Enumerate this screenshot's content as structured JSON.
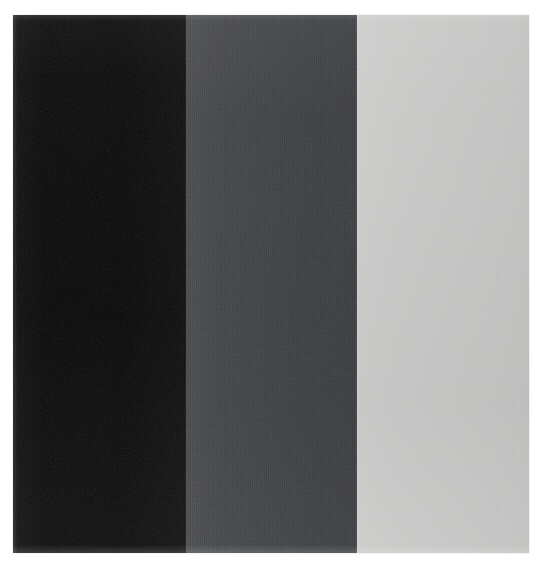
{
  "artwork": {
    "kind": "abstract-painting-photograph",
    "description": "Three vertical bands of graduated grey tone on a square canvas",
    "background_color": "#ffffff",
    "panel": {
      "left": 13,
      "top": 15,
      "width": 516,
      "height": 538
    },
    "bands": [
      {
        "name": "dark-band",
        "label": "Black",
        "color": "#0d0d0e",
        "left": 0,
        "width": 173,
        "tone_value": "near-black"
      },
      {
        "name": "mid-band",
        "label": "Dark Slate Grey",
        "color": "#414346",
        "left": 173,
        "width": 171,
        "tone_value": "mid-dark-grey"
      },
      {
        "name": "light-band",
        "label": "Light Grey",
        "color": "#c9cac8",
        "left": 344,
        "width": 172,
        "tone_value": "light-grey"
      }
    ],
    "texture": {
      "name": "canvas-weave",
      "direction": "vertical",
      "intensity": "fine"
    }
  }
}
